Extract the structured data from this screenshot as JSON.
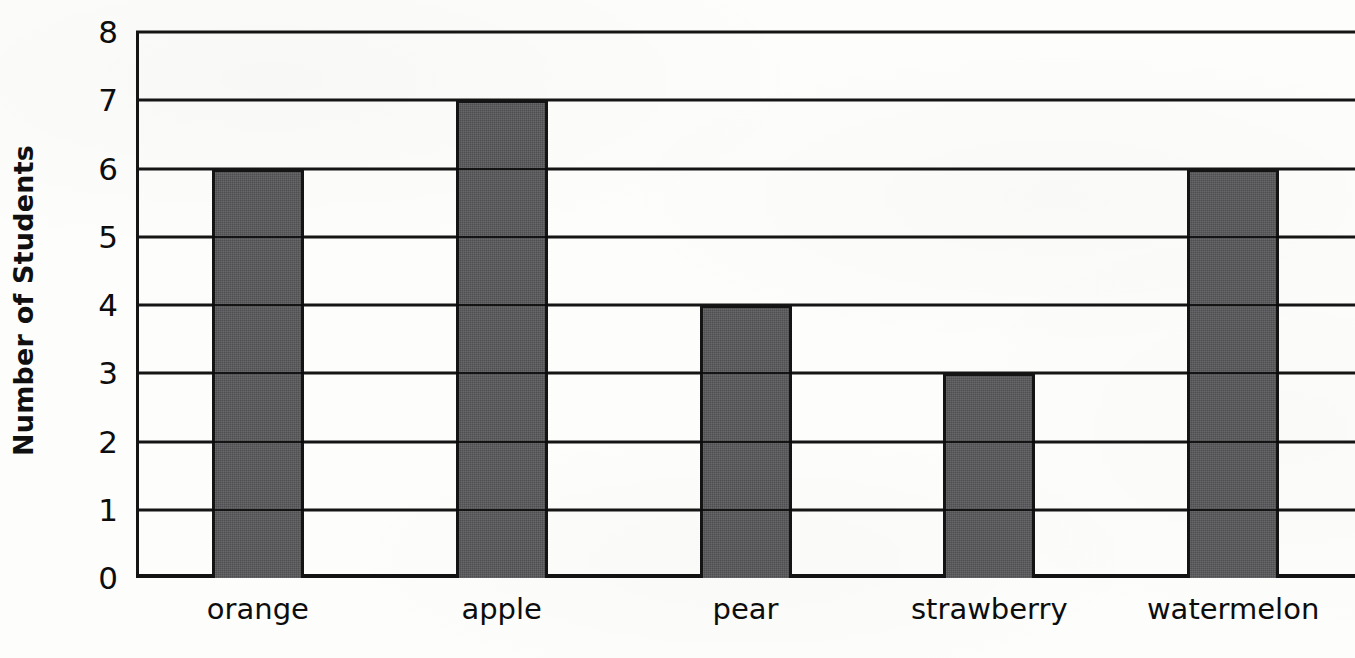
{
  "chart_data": {
    "type": "bar",
    "title": "",
    "subtitle": "",
    "xlabel": "",
    "ylabel": "Number of Students",
    "categories": [
      "orange",
      "apple",
      "pear",
      "strawberry",
      "watermelon"
    ],
    "values": [
      6,
      7,
      4,
      3,
      6
    ],
    "ylim": [
      0,
      8
    ],
    "y_ticks": [
      0,
      1,
      2,
      3,
      4,
      5,
      6,
      7,
      8
    ],
    "y_tick_labels": [
      "0",
      "1",
      "2",
      "3",
      "4",
      "5",
      "6",
      "7",
      "8"
    ],
    "grid": "horizontal",
    "legend": "none",
    "bar_color": "#57575a",
    "bar_edge_color": "#141414",
    "axis_color": "#151515",
    "background_color": "#fdfdfb"
  },
  "axes": {
    "y_title": "Number of Students"
  }
}
